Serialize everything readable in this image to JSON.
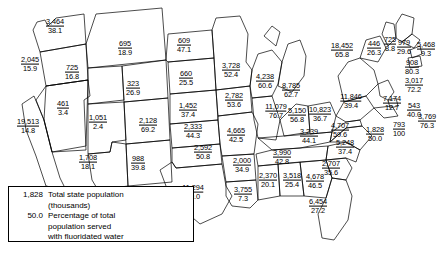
{
  "figure": {
    "type": "choropleth-value-map",
    "region": "United States"
  },
  "legend": {
    "sample_population": "1,828",
    "sample_population_desc_line1": "Total state population",
    "sample_population_desc_line2": "(thousands)",
    "sample_percent": "50.0",
    "sample_percent_desc_line1": "Percentage of total",
    "sample_percent_desc_line2": "population served",
    "sample_percent_desc_line3": "with fluoridated water"
  },
  "chart_data": {
    "type": "map",
    "title": "",
    "value_labels": [
      "Total state population (thousands)",
      "Percentage of total population served with fluoridated water"
    ],
    "states": [
      {
        "code": "WA",
        "population": "3,464",
        "percent": "38.1",
        "x": 55,
        "y": 26
      },
      {
        "code": "OR",
        "population": "2,045",
        "percent": "15.9",
        "x": 30,
        "y": 64
      },
      {
        "code": "ID",
        "population": "725",
        "percent": "16.8",
        "x": 72,
        "y": 72
      },
      {
        "code": "MT",
        "population": "695",
        "percent": "18.9",
        "x": 125,
        "y": 48
      },
      {
        "code": "ND",
        "population": "609",
        "percent": "47.1",
        "x": 184,
        "y": 45
      },
      {
        "code": "SD",
        "population": "660",
        "percent": "25.5",
        "x": 186,
        "y": 78
      },
      {
        "code": "NE",
        "population": "1,452",
        "percent": "37.4",
        "x": 188,
        "y": 110
      },
      {
        "code": "WY",
        "population": "323",
        "percent": "26.9",
        "x": 133,
        "y": 88
      },
      {
        "code": "NV",
        "population": "461",
        "percent": "3.4",
        "x": 63,
        "y": 108
      },
      {
        "code": "CA",
        "population": "19,513",
        "percent": "14.8",
        "x": 28,
        "y": 126
      },
      {
        "code": "UT",
        "population": "1,051",
        "percent": "2.4",
        "x": 98,
        "y": 122
      },
      {
        "code": "AZ",
        "population": "1,708",
        "percent": "18.1",
        "x": 88,
        "y": 162
      },
      {
        "code": "NM",
        "population": "988",
        "percent": "39.8",
        "x": 138,
        "y": 163
      },
      {
        "code": "CO",
        "population": "2,128",
        "percent": "69.2",
        "x": 148,
        "y": 125
      },
      {
        "code": "KS",
        "population": "2,333",
        "percent": "44.3",
        "x": 193,
        "y": 131
      },
      {
        "code": "OK",
        "population": "2,592",
        "percent": "50.8",
        "x": 203,
        "y": 152
      },
      {
        "code": "TX",
        "population": "11,294",
        "percent": "49.0",
        "x": 193,
        "y": 192
      },
      {
        "code": "MN",
        "population": "3,728",
        "percent": "52.4",
        "x": 231,
        "y": 70
      },
      {
        "code": "IA",
        "population": "2,782",
        "percent": "53.6",
        "x": 234,
        "y": 100
      },
      {
        "code": "MO",
        "population": "4,665",
        "percent": "42.5",
        "x": 236,
        "y": 135
      },
      {
        "code": "AR",
        "population": "2,000",
        "percent": "34.9",
        "x": 242,
        "y": 165
      },
      {
        "code": "LA",
        "population": "3,755",
        "percent": "7.3",
        "x": 243,
        "y": 194
      },
      {
        "code": "WI",
        "population": "4,238",
        "percent": "60.6",
        "x": 265,
        "y": 81
      },
      {
        "code": "IL",
        "population": "11,079",
        "percent": "76.7",
        "x": 276,
        "y": 111
      },
      {
        "code": "MI",
        "population": "8,785",
        "percent": "62.7",
        "x": 291,
        "y": 90
      },
      {
        "code": "IN",
        "population": "5,150",
        "percent": "56.8",
        "x": 297,
        "y": 115
      },
      {
        "code": "OH",
        "population": "10,823",
        "percent": "36.7",
        "x": 320,
        "y": 114
      },
      {
        "code": "KY",
        "population": "3,239",
        "percent": "44.1",
        "x": 309,
        "y": 136
      },
      {
        "code": "TN",
        "population": "3,990",
        "percent": "42.8",
        "x": 282,
        "y": 157
      },
      {
        "code": "MS",
        "population": "2,370",
        "percent": "20.1",
        "x": 268,
        "y": 180
      },
      {
        "code": "AL",
        "population": "3,518",
        "percent": "25.4",
        "x": 292,
        "y": 180
      },
      {
        "code": "GA",
        "population": "4,678",
        "percent": "46.5",
        "x": 315,
        "y": 181
      },
      {
        "code": "FL",
        "population": "6,454",
        "percent": "27.2",
        "x": 318,
        "y": 206
      },
      {
        "code": "SC",
        "population": "2,707",
        "percent": "35.6",
        "x": 331,
        "y": 168
      },
      {
        "code": "NC",
        "population": "5,248",
        "percent": "37.4",
        "x": 345,
        "y": 147
      },
      {
        "code": "VA",
        "population": "4,707",
        "percent": "59.6",
        "x": 340,
        "y": 130
      },
      {
        "code": "WV",
        "population": "1,828",
        "percent": "50.0",
        "x": 375,
        "y": 134
      },
      {
        "code": "PA",
        "population": "11,846",
        "percent": "39.4",
        "x": 351,
        "y": 101
      },
      {
        "code": "NY",
        "population": "18,452",
        "percent": "65.8",
        "x": 342,
        "y": 50
      },
      {
        "code": "VT",
        "population": "446",
        "percent": "26.3",
        "x": 374,
        "y": 48
      },
      {
        "code": "ME",
        "population": "725",
        "percent": "8.8",
        "x": 390,
        "y": 44
      },
      {
        "code": "NH",
        "population": "979",
        "percent": "29.6",
        "x": 404,
        "y": 47
      },
      {
        "code": "MA",
        "population": "5,468",
        "percent": "9.3",
        "x": 426,
        "y": 49
      },
      {
        "code": "RI",
        "population": "908",
        "percent": "80.3",
        "x": 412,
        "y": 67
      },
      {
        "code": "CT",
        "population": "3,017",
        "percent": "72.2",
        "x": 414,
        "y": 85
      },
      {
        "code": "NJ",
        "population": "7,174",
        "percent": "12.7",
        "x": 392,
        "y": 103
      },
      {
        "code": "DE",
        "population": "543",
        "percent": "40.0",
        "x": 414,
        "y": 110
      },
      {
        "code": "MD",
        "population": "3,769",
        "percent": "76.3",
        "x": 427,
        "y": 121
      },
      {
        "code": "DC",
        "population": "793",
        "percent": "100",
        "x": 399,
        "y": 129
      }
    ]
  }
}
